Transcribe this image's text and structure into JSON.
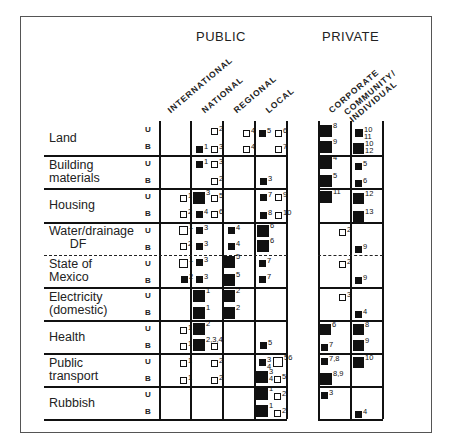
{
  "title_headers": {
    "public": "PUBLIC",
    "private": "PRIVATE"
  },
  "columns": [
    {
      "label": "INTERNATIONAL",
      "group": "public"
    },
    {
      "label": "NATIONAL",
      "group": "public"
    },
    {
      "label": "REGIONAL",
      "group": "public"
    },
    {
      "label": "LOCAL",
      "group": "public"
    },
    {
      "label": "CORPORATE",
      "group": "private"
    },
    {
      "label": "COMMUNITY/\nINDIVIDUAL",
      "group": "private"
    }
  ],
  "rows": [
    {
      "label": "Land",
      "sub": [
        "U",
        "B"
      ]
    },
    {
      "label": "Building\nmaterials",
      "sub": [
        "U",
        "B"
      ]
    },
    {
      "label": "Housing",
      "sub": [
        "U",
        "B"
      ]
    },
    {
      "label": "Water/drainage\n      DF",
      "sub": [
        "U",
        "B"
      ]
    },
    {
      "label": "State of\nMexico",
      "sub": [
        "U",
        "B"
      ]
    },
    {
      "label": "Electricity\n(domestic)",
      "sub": [
        "U",
        "B"
      ]
    },
    {
      "label": "Health",
      "sub": [
        "U",
        "B"
      ]
    },
    {
      "label": "Public\ntransport",
      "sub": [
        "U",
        "B"
      ]
    },
    {
      "label": "Rubbish",
      "sub": [
        "U",
        "B"
      ]
    }
  ],
  "legend_note": "U = upper-income, B = lower-income; filled square = major role, open square = minor role; square size indicates degree of involvement",
  "markers": [
    {
      "x": 211,
      "y": 128,
      "s": 7,
      "t": "open",
      "n": "2"
    },
    {
      "x": 196,
      "y": 146,
      "s": 7,
      "t": "filled",
      "n": "1"
    },
    {
      "x": 211,
      "y": 146,
      "s": 7,
      "t": "open",
      "n": "3"
    },
    {
      "x": 243,
      "y": 130,
      "s": 7,
      "t": "open",
      "n": "4"
    },
    {
      "x": 243,
      "y": 146,
      "s": 7,
      "t": "open",
      "n": "4"
    },
    {
      "x": 259,
      "y": 130,
      "s": 7,
      "t": "filled",
      "n": "5"
    },
    {
      "x": 275,
      "y": 130,
      "s": 7,
      "t": "open",
      "n": "6"
    },
    {
      "x": 275,
      "y": 146,
      "s": 7,
      "t": "open",
      "n": "7"
    },
    {
      "x": 320,
      "y": 125,
      "s": 12,
      "t": "filled",
      "n": "8"
    },
    {
      "x": 320,
      "y": 141,
      "s": 12,
      "t": "filled",
      "n": "9"
    },
    {
      "x": 355,
      "y": 129,
      "s": 8,
      "t": "filled",
      "n": "10\n11"
    },
    {
      "x": 353,
      "y": 143,
      "s": 11,
      "t": "filled",
      "n": "10\n12"
    },
    {
      "x": 196,
      "y": 161,
      "s": 7,
      "t": "filled",
      "n": "1"
    },
    {
      "x": 211,
      "y": 161,
      "s": 7,
      "t": "open",
      "n": "3"
    },
    {
      "x": 211,
      "y": 178,
      "s": 7,
      "t": "open",
      "n": "2"
    },
    {
      "x": 260,
      "y": 178,
      "s": 7,
      "t": "filled",
      "n": "3"
    },
    {
      "x": 320,
      "y": 157,
      "s": 12,
      "t": "filled",
      "n": "4"
    },
    {
      "x": 320,
      "y": 175,
      "s": 12,
      "t": "filled",
      "n": "5"
    },
    {
      "x": 355,
      "y": 163,
      "s": 7,
      "t": "filled",
      "n": "5"
    },
    {
      "x": 355,
      "y": 180,
      "s": 7,
      "t": "filled",
      "n": "6"
    },
    {
      "x": 180,
      "y": 195,
      "s": 7,
      "t": "open",
      "n": "1"
    },
    {
      "x": 193,
      "y": 192,
      "s": 12,
      "t": "filled",
      "n": "3"
    },
    {
      "x": 211,
      "y": 195,
      "s": 7,
      "t": "open",
      "n": "5"
    },
    {
      "x": 180,
      "y": 211,
      "s": 7,
      "t": "open",
      "n": "2"
    },
    {
      "x": 196,
      "y": 211,
      "s": 7,
      "t": "filled",
      "n": "4"
    },
    {
      "x": 211,
      "y": 211,
      "s": 7,
      "t": "open",
      "n": "6"
    },
    {
      "x": 260,
      "y": 194,
      "s": 7,
      "t": "filled",
      "n": "7"
    },
    {
      "x": 275,
      "y": 194,
      "s": 7,
      "t": "open",
      "n": "9"
    },
    {
      "x": 260,
      "y": 212,
      "s": 7,
      "t": "filled",
      "n": "8"
    },
    {
      "x": 275,
      "y": 212,
      "s": 7,
      "t": "open",
      "n": "10"
    },
    {
      "x": 320,
      "y": 191,
      "s": 12,
      "t": "filled",
      "n": "11"
    },
    {
      "x": 353,
      "y": 193,
      "s": 11,
      "t": "filled",
      "n": "12"
    },
    {
      "x": 353,
      "y": 211,
      "s": 11,
      "t": "filled",
      "n": "13"
    },
    {
      "x": 179,
      "y": 226,
      "s": 9,
      "t": "open",
      "n": "1"
    },
    {
      "x": 196,
      "y": 227,
      "s": 7,
      "t": "filled",
      "n": "3"
    },
    {
      "x": 228,
      "y": 227,
      "s": 7,
      "t": "filled",
      "n": "4"
    },
    {
      "x": 257,
      "y": 225,
      "s": 12,
      "t": "filled",
      "n": "6"
    },
    {
      "x": 180,
      "y": 243,
      "s": 7,
      "t": "open",
      "n": "2"
    },
    {
      "x": 196,
      "y": 243,
      "s": 7,
      "t": "filled",
      "n": "3"
    },
    {
      "x": 228,
      "y": 243,
      "s": 7,
      "t": "filled",
      "n": "4"
    },
    {
      "x": 257,
      "y": 240,
      "s": 12,
      "t": "filled",
      "n": "6"
    },
    {
      "x": 339,
      "y": 229,
      "s": 7,
      "t": "open",
      "n": "2"
    },
    {
      "x": 355,
      "y": 246,
      "s": 7,
      "t": "filled",
      "n": "9"
    },
    {
      "x": 179,
      "y": 259,
      "s": 9,
      "t": "open",
      "n": "1"
    },
    {
      "x": 196,
      "y": 259,
      "s": 7,
      "t": "filled",
      "n": "3"
    },
    {
      "x": 223,
      "y": 256,
      "s": 12,
      "t": "filled",
      "n": "5"
    },
    {
      "x": 259,
      "y": 260,
      "s": 7,
      "t": "filled",
      "n": "7"
    },
    {
      "x": 181,
      "y": 276,
      "s": 7,
      "t": "filled",
      "n": "2"
    },
    {
      "x": 196,
      "y": 276,
      "s": 7,
      "t": "filled",
      "n": "3"
    },
    {
      "x": 223,
      "y": 274,
      "s": 12,
      "t": "filled",
      "n": "5"
    },
    {
      "x": 259,
      "y": 276,
      "s": 7,
      "t": "filled",
      "n": "7"
    },
    {
      "x": 339,
      "y": 261,
      "s": 7,
      "t": "open",
      "n": "2"
    },
    {
      "x": 355,
      "y": 277,
      "s": 7,
      "t": "filled",
      "n": "9"
    },
    {
      "x": 193,
      "y": 290,
      "s": 12,
      "t": "filled",
      "n": "1"
    },
    {
      "x": 223,
      "y": 290,
      "s": 12,
      "t": "filled",
      "n": "2"
    },
    {
      "x": 193,
      "y": 307,
      "s": 12,
      "t": "filled",
      "n": "1"
    },
    {
      "x": 223,
      "y": 307,
      "s": 12,
      "t": "filled",
      "n": "2"
    },
    {
      "x": 339,
      "y": 294,
      "s": 7,
      "t": "open",
      "n": "3"
    },
    {
      "x": 355,
      "y": 311,
      "s": 7,
      "t": "filled",
      "n": "4"
    },
    {
      "x": 180,
      "y": 327,
      "s": 7,
      "t": "open",
      "n": "1"
    },
    {
      "x": 193,
      "y": 323,
      "s": 12,
      "t": "filled",
      "n": "2"
    },
    {
      "x": 180,
      "y": 343,
      "s": 7,
      "t": "open",
      "n": "1"
    },
    {
      "x": 193,
      "y": 339,
      "s": 12,
      "t": "filled",
      "n": "2,3,4"
    },
    {
      "x": 211,
      "y": 343,
      "s": 7,
      "t": "open",
      "n": ""
    },
    {
      "x": 260,
      "y": 342,
      "s": 7,
      "t": "filled",
      "n": "5"
    },
    {
      "x": 320,
      "y": 324,
      "s": 11,
      "t": "filled",
      "n": "6"
    },
    {
      "x": 321,
      "y": 344,
      "s": 7,
      "t": "filled",
      "n": "7"
    },
    {
      "x": 353,
      "y": 324,
      "s": 11,
      "t": "filled",
      "n": "8"
    },
    {
      "x": 353,
      "y": 340,
      "s": 11,
      "t": "filled",
      "n": "9"
    },
    {
      "x": 180,
      "y": 360,
      "s": 7,
      "t": "open",
      "n": "1"
    },
    {
      "x": 211,
      "y": 360,
      "s": 7,
      "t": "open",
      "n": "2"
    },
    {
      "x": 180,
      "y": 377,
      "s": 7,
      "t": "open",
      "n": "1"
    },
    {
      "x": 211,
      "y": 377,
      "s": 7,
      "t": "open",
      "n": "2"
    },
    {
      "x": 259,
      "y": 359,
      "s": 7,
      "t": "filled",
      "n": "3\n4"
    },
    {
      "x": 273,
      "y": 357,
      "s": 10,
      "t": "open",
      "n": "56"
    },
    {
      "x": 256,
      "y": 371,
      "s": 12,
      "t": "filled",
      "n": "3\n4"
    },
    {
      "x": 274,
      "y": 376,
      "s": 7,
      "t": "open",
      "n": "5"
    },
    {
      "x": 321,
      "y": 358,
      "s": 7,
      "t": "filled",
      "n": "7,8"
    },
    {
      "x": 320,
      "y": 373,
      "s": 12,
      "t": "filled",
      "n": "8,9"
    },
    {
      "x": 353,
      "y": 357,
      "s": 11,
      "t": "filled",
      "n": "10"
    },
    {
      "x": 256,
      "y": 388,
      "s": 12,
      "t": "filled",
      "n": "1"
    },
    {
      "x": 274,
      "y": 393,
      "s": 7,
      "t": "open",
      "n": "2"
    },
    {
      "x": 256,
      "y": 405,
      "s": 12,
      "t": "filled",
      "n": "1"
    },
    {
      "x": 274,
      "y": 410,
      "s": 7,
      "t": "open",
      "n": "2"
    },
    {
      "x": 321,
      "y": 392,
      "s": 7,
      "t": "filled",
      "n": "3"
    },
    {
      "x": 355,
      "y": 411,
      "s": 7,
      "t": "filled",
      "n": "4"
    }
  ]
}
